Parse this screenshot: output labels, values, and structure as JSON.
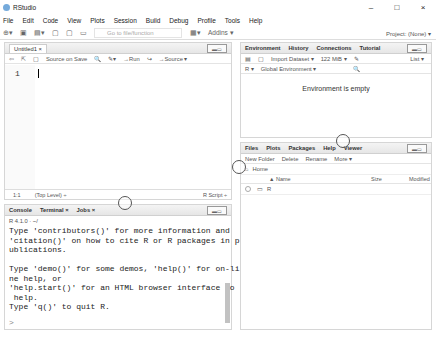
{
  "window": {
    "title": "RStudio",
    "controls": [
      "–",
      "□",
      "×"
    ]
  },
  "menu": [
    "File",
    "Edit",
    "Code",
    "View",
    "Plots",
    "Session",
    "Build",
    "Debug",
    "Profile",
    "Tools",
    "Help"
  ],
  "toolbar": {
    "goto_placeholder": "Go to file/function",
    "addins": "Addins ▾",
    "project": "Project: (None) ▾"
  },
  "editor": {
    "tab": "Untitled1 ×",
    "tools": {
      "source_on_save": "Source on Save",
      "run": "→Run",
      "rerun": "↪",
      "source": "→Source ▾"
    },
    "line_number": "1",
    "status": {
      "position": "1:1",
      "scope": "(Top Level) ÷",
      "type": "R Script ÷"
    }
  },
  "environment": {
    "tabs": [
      "Environment",
      "History",
      "Connections",
      "Tutorial"
    ],
    "tools": {
      "import": "Import Dataset ▾",
      "memory": "122 MiB ▾",
      "list": "List ▾"
    },
    "scope": {
      "lang": "R ▾",
      "env": "Global Environment ▾"
    },
    "empty": "Environment is empty"
  },
  "files": {
    "tabs": [
      "Files",
      "Plots",
      "Packages",
      "Help",
      "Viewer"
    ],
    "tools": {
      "new_folder": "New Folder",
      "delete": "Delete",
      "rename": "Rename",
      "more": "More ▾"
    },
    "breadcrumb": "Home",
    "columns": {
      "name": "▲ Name",
      "size": "Size",
      "modified": "Modified"
    },
    "rows": [
      {
        "name": "R"
      }
    ]
  },
  "console": {
    "tabs": [
      "Console",
      "Terminal ×",
      "Jobs ×"
    ],
    "version": "R 4.1.0 · ~/",
    "lines": "Type 'contributors()' for more information and\n'citation()' on how to cite R or R packages in p\nublications.\n\nType 'demo()' for some demos, 'help()' for on-li\nne help, or\n'help.start()' for an HTML browser interface to\n help.\nType 'q()' to quit R.",
    "prompt": ">"
  }
}
